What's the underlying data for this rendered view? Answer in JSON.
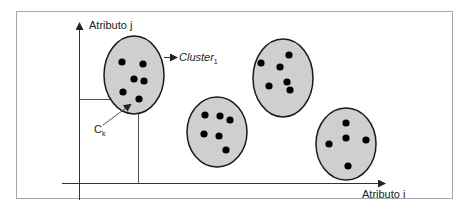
{
  "axes": {
    "y_label": "Atributo j",
    "x_label": "Atributo i"
  },
  "annotations": {
    "cluster_label_main": "Cluster",
    "cluster_label_sub": "1",
    "centroid_label_main": "C",
    "centroid_label_sub": "k"
  },
  "colors": {
    "cluster_fill": "#cfcfcf",
    "cluster_stroke": "#1a1a1a",
    "point": "#000000",
    "frame": "#a0a0a0",
    "axis": "#333333"
  },
  "clusters": [
    {
      "name": "cluster-1",
      "cx": 134,
      "cy": 75,
      "rx": 30,
      "ry": 39,
      "points": [
        [
          122,
          62
        ],
        [
          143,
          64
        ],
        [
          134,
          79
        ],
        [
          144,
          81
        ],
        [
          123,
          92
        ],
        [
          139,
          99
        ]
      ]
    },
    {
      "name": "cluster-2",
      "cx": 217,
      "cy": 132,
      "rx": 30,
      "ry": 35,
      "points": [
        [
          205,
          115
        ],
        [
          220,
          116
        ],
        [
          230,
          120
        ],
        [
          204,
          134
        ],
        [
          219,
          136
        ],
        [
          226,
          150
        ]
      ]
    },
    {
      "name": "cluster-3",
      "cx": 283,
      "cy": 78,
      "rx": 30,
      "ry": 39,
      "points": [
        [
          289,
          55
        ],
        [
          261,
          63
        ],
        [
          280,
          67
        ],
        [
          287,
          82
        ],
        [
          269,
          86
        ],
        [
          290,
          90
        ]
      ]
    },
    {
      "name": "cluster-4",
      "cx": 346,
      "cy": 144,
      "rx": 30,
      "ry": 36,
      "points": [
        [
          346,
          123
        ],
        [
          346,
          138
        ],
        [
          329,
          144
        ],
        [
          366,
          140
        ],
        [
          348,
          166
        ]
      ]
    }
  ]
}
